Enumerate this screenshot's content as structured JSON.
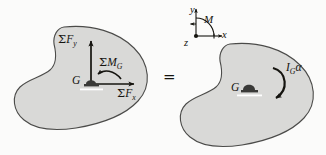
{
  "figure": {
    "type": "free-body-and-kinetic-diagram",
    "equals_sign": "=",
    "colors": {
      "background": "#fbfbfa",
      "body_fill": "#d9d9d7",
      "body_stroke": "#4b4b49",
      "ink": "#15140f"
    }
  },
  "free_body_diagram": {
    "name": "free-body-diagram",
    "center_label": "G",
    "forces": [
      {
        "name": "sum-forces-y",
        "symbol_sigma": "Σ",
        "symbol_base": "F",
        "symbol_sub": "y",
        "direction": "up"
      },
      {
        "name": "sum-forces-x",
        "symbol_sigma": "Σ",
        "symbol_base": "F",
        "symbol_sub": "x",
        "direction": "right"
      }
    ],
    "moment": {
      "name": "sum-moments-g",
      "symbol_sigma": "Σ",
      "symbol_base": "M",
      "symbol_sub": "G",
      "direction": "counterclockwise"
    }
  },
  "kinetic_diagram": {
    "name": "kinetic-diagram",
    "center_label": "G",
    "moment": {
      "name": "moment-of-inertia-times-alpha",
      "symbol_base": "I",
      "symbol_sub": "G",
      "symbol_tail": "α",
      "direction": "clockwise"
    }
  },
  "axes_legend": {
    "name": "coordinate-axes-legend",
    "y_label": "y",
    "x_label": "x",
    "z_label": "z",
    "moment_label": "M",
    "z_convention": "out-of-page"
  }
}
